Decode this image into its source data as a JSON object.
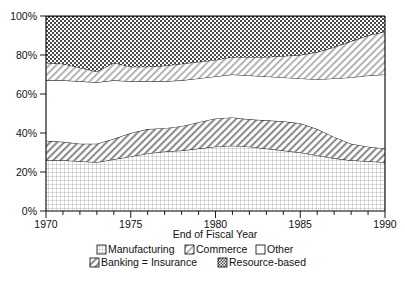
{
  "chart_data": {
    "type": "area",
    "title": "",
    "xlabel": "End of Fiscal Year",
    "ylabel": "",
    "stacked": true,
    "normalized_percent": true,
    "grid": false,
    "legend_position": "bottom",
    "xlim": [
      1970,
      1990
    ],
    "ylim": [
      0,
      100
    ],
    "xticks": [
      1970,
      1975,
      1980,
      1985,
      1990
    ],
    "xtick_labels": [
      "1970",
      "1975",
      "1980",
      "1985",
      "1990"
    ],
    "x_minor_tick_step": 1,
    "yticks": [
      0,
      20,
      40,
      60,
      80,
      100
    ],
    "ytick_labels": [
      "0%",
      "20%",
      "40%",
      "60%",
      "80%",
      "100%"
    ],
    "x": [
      1970,
      1971,
      1972,
      1973,
      1974,
      1975,
      1976,
      1977,
      1978,
      1979,
      1980,
      1981,
      1982,
      1983,
      1984,
      1985,
      1986,
      1987,
      1988,
      1989,
      1990
    ],
    "series": [
      {
        "name": "Manufacturing",
        "pattern": "fine-dot-grid",
        "values": [
          26,
          26,
          25.5,
          25,
          26.5,
          28,
          29.5,
          30.5,
          31,
          32,
          33,
          33.5,
          33,
          32,
          31,
          30,
          28.5,
          27,
          26,
          25.5,
          25
        ]
      },
      {
        "name": "Banking = Insurance",
        "pattern": "diagonal-hatch",
        "values": [
          10,
          9.5,
          9,
          9.5,
          10.5,
          12,
          12.5,
          12,
          12.5,
          13.5,
          14.5,
          14.5,
          14,
          14.5,
          15,
          15,
          13.5,
          11,
          8.5,
          7.5,
          7
        ]
      },
      {
        "name": "Other",
        "pattern": "blank",
        "values": [
          31,
          31.5,
          32,
          31.5,
          30,
          26.5,
          24.5,
          24,
          23.5,
          22.5,
          21.5,
          22,
          22.5,
          22.5,
          22.5,
          23,
          25.5,
          30,
          34,
          36.5,
          38
        ]
      },
      {
        "name": "Commerce",
        "pattern": "diagonal-hatch-light",
        "values": [
          9,
          8.5,
          7,
          5.5,
          9,
          7.5,
          7.5,
          8,
          8.5,
          8.5,
          8.5,
          9,
          9.5,
          10,
          11,
          12,
          14,
          16,
          18.5,
          20.5,
          22
        ]
      },
      {
        "name": "Resource-based",
        "pattern": "dark-checker",
        "values": [
          24,
          24.5,
          26.5,
          28.5,
          24,
          26,
          26,
          25.5,
          24.5,
          23.5,
          22.5,
          21,
          21,
          21,
          20.5,
          20,
          18.5,
          16,
          13,
          10,
          8
        ]
      }
    ],
    "cumulative_boundaries": {
      "manufacturing_top": [
        26,
        26,
        25.5,
        25,
        26.5,
        28,
        29.5,
        30.5,
        31,
        32,
        33,
        33.5,
        33,
        32,
        31,
        30,
        28.5,
        27,
        26,
        25.5,
        25
      ],
      "banking_top": [
        36,
        35.5,
        34.5,
        34.5,
        37,
        40,
        42,
        42.5,
        43.5,
        45.5,
        47.5,
        48,
        47,
        46.5,
        46,
        45,
        42,
        38,
        34.5,
        33,
        32
      ],
      "other_top": [
        67,
        67,
        66.5,
        66,
        67,
        66.5,
        66.5,
        66.5,
        67,
        68,
        69,
        70,
        69.5,
        69,
        68.5,
        68,
        67.5,
        68,
        68.5,
        69.5,
        70
      ],
      "commerce_top": [
        76,
        75.5,
        73.5,
        71.5,
        76,
        74,
        74,
        74.5,
        75.5,
        76.5,
        77.5,
        79,
        79,
        79,
        79.5,
        80,
        81.5,
        84,
        87,
        90,
        92
      ],
      "resource_top": [
        100,
        100,
        100,
        100,
        100,
        100,
        100,
        100,
        100,
        100,
        100,
        100,
        100,
        100,
        100,
        100,
        100,
        100,
        100,
        100,
        100
      ]
    }
  },
  "axes": {
    "x_title": "End of Fiscal Year",
    "y_tick_labels": [
      "100%",
      "80%",
      "60%",
      "40%",
      "20%",
      "0%"
    ],
    "x_tick_labels": [
      "1970",
      "1975",
      "1980",
      "1985",
      "1990"
    ]
  },
  "legend": {
    "row1": [
      {
        "label": "Manufacturing",
        "swatch": "fine-dot-grid"
      },
      {
        "label": "Commerce",
        "swatch": "diagonal-hatch-light"
      },
      {
        "label": "Other",
        "swatch": "blank"
      }
    ],
    "row2": [
      {
        "label": "Banking = Insurance",
        "swatch": "diagonal-hatch"
      },
      {
        "label": "Resource-based",
        "swatch": "dark-checker"
      }
    ]
  }
}
